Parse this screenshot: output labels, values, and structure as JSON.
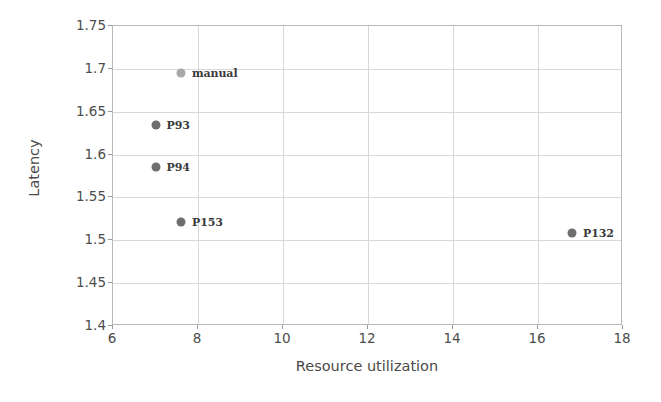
{
  "chart_data": {
    "type": "scatter",
    "title": "",
    "xlabel": "Resource utilization",
    "ylabel": "Latency",
    "xlim": [
      6,
      18
    ],
    "ylim": [
      1.4,
      1.75
    ],
    "xticks": [
      "6",
      "8",
      "10",
      "12",
      "14",
      "16",
      "18"
    ],
    "yticks": [
      "1.4",
      "1.45",
      "1.5",
      "1.55",
      "1.6",
      "1.65",
      "1.7",
      "1.75"
    ],
    "grid": true,
    "legend": "none",
    "marker_color": "#6e6e6e",
    "highlight_color": "#a8a8a8",
    "points": [
      {
        "label": "manual",
        "x": 7.6,
        "y": 1.695,
        "color": "#a8a8a8"
      },
      {
        "label": "P93",
        "x": 7.0,
        "y": 1.635,
        "color": "#6e6e6e"
      },
      {
        "label": "P94",
        "x": 7.0,
        "y": 1.585,
        "color": "#6e6e6e"
      },
      {
        "label": "P153",
        "x": 7.6,
        "y": 1.521,
        "color": "#6e6e6e"
      },
      {
        "label": "P132",
        "x": 16.8,
        "y": 1.508,
        "color": "#6e6e6e"
      }
    ]
  }
}
